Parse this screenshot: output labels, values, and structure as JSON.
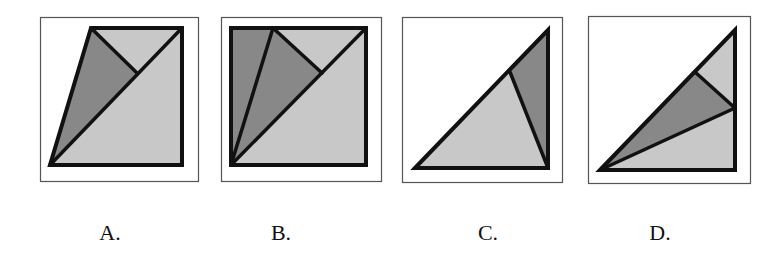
{
  "colors": {
    "frame": "#555555",
    "stroke": "#111111",
    "light": "#c8c8c8",
    "dark": "#888888",
    "background": "#ffffff"
  },
  "options": [
    {
      "label": "A.",
      "frame": [
        40,
        17,
        158,
        164
      ],
      "polygons": [
        {
          "fill": "light",
          "points": "91,28 182,28 137,73"
        },
        {
          "fill": "dark",
          "points": "91,28 137,73 50,165"
        },
        {
          "fill": "light",
          "points": "50,165 182,28 182,165"
        }
      ],
      "outline": "91,28 182,28 182,165 50,165",
      "lines": [
        [
          50,
          165,
          182,
          28
        ],
        [
          91,
          28,
          137,
          73
        ]
      ]
    },
    {
      "label": "B.",
      "frame": [
        221,
        17,
        160,
        164
      ],
      "polygons": [
        {
          "fill": "dark",
          "points": "231,28 273,28 231,165"
        },
        {
          "fill": "dark",
          "points": "273,28 322,73 231,165"
        },
        {
          "fill": "light",
          "points": "273,28 366,28 322,73"
        },
        {
          "fill": "light",
          "points": "231,165 366,28 366,165"
        }
      ],
      "outline": "231,28 366,28 366,165 231,165",
      "lines": [
        [
          231,
          165,
          366,
          28
        ],
        [
          273,
          28,
          231,
          165
        ],
        [
          273,
          28,
          322,
          73
        ]
      ]
    },
    {
      "label": "C.",
      "frame": [
        402,
        17,
        160,
        165
      ],
      "polygons": [
        {
          "fill": "light",
          "points": "415,168 510,72 548,168"
        },
        {
          "fill": "dark",
          "points": "510,72 548,30 548,168"
        }
      ],
      "outline": "415,168 548,30 548,168",
      "lines": [
        [
          510,
          72,
          548,
          168
        ]
      ]
    },
    {
      "label": "D.",
      "frame": [
        588,
        16,
        162,
        167
      ],
      "polygons": [
        {
          "fill": "light",
          "points": "695,72 735,30 735,108"
        },
        {
          "fill": "dark",
          "points": "600,170 695,72 735,108"
        },
        {
          "fill": "light",
          "points": "600,170 735,108 735,170"
        }
      ],
      "outline": "600,170 735,30 735,170",
      "lines": [
        [
          695,
          72,
          735,
          108
        ],
        [
          600,
          170,
          735,
          108
        ]
      ]
    }
  ],
  "labels": [
    {
      "text": "A.",
      "x": 110
    },
    {
      "text": "B.",
      "x": 281
    },
    {
      "text": "C.",
      "x": 488
    },
    {
      "text": "D.",
      "x": 660
    }
  ]
}
